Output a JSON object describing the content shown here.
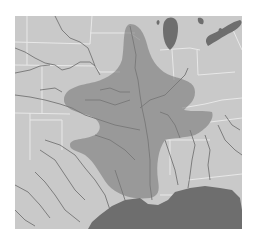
{
  "map": {
    "type": "range-map",
    "region": "Central United States / Mississippi River basin",
    "colors": {
      "background": "#ffffff",
      "land": "#c9c9c9",
      "water": "#6e6e6e",
      "range_fill": "#8a8a8a",
      "state_border": "#e6e6e6",
      "river": "#6a6a6a"
    },
    "layers": [
      "land",
      "state-borders",
      "rivers",
      "range-shading",
      "great-lakes",
      "gulf-of-mexico"
    ],
    "labels": []
  }
}
